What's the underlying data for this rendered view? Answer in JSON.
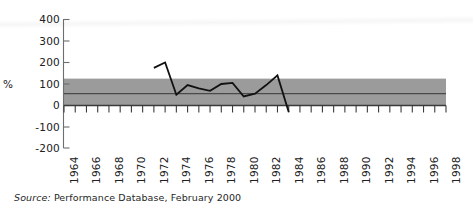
{
  "chart_data": {
    "type": "line",
    "title": "",
    "subtitle": "",
    "xlabel": "",
    "ylabel": "%",
    "ylim": [
      -200,
      400
    ],
    "xlim": [
      1964,
      1998
    ],
    "grid": false,
    "legend": null,
    "y_ticks": [
      400,
      300,
      200,
      100,
      0,
      -100,
      -200
    ],
    "y_tick_labels": [
      "400",
      "300",
      "200",
      "100",
      "0",
      "-100",
      "-200"
    ],
    "x_ticks": [
      1964,
      1966,
      1968,
      1970,
      1972,
      1974,
      1976,
      1978,
      1980,
      1982,
      1984,
      1986,
      1988,
      1990,
      1992,
      1994,
      1996,
      1998
    ],
    "x_tick_labels": [
      "1964",
      "1966",
      "1968",
      "1970",
      "1972",
      "1974",
      "1976",
      "1978",
      "1980",
      "1982",
      "1984",
      "1986",
      "1988",
      "1990",
      "1992",
      "1994",
      "1996",
      "1998"
    ],
    "x_minor_tick_step": 1,
    "series": [
      {
        "name": "performance",
        "color": "#111111",
        "x": [
          1972,
          1973,
          1974,
          1975,
          1976,
          1977,
          1978,
          1979,
          1980,
          1981,
          1982,
          1983,
          1984
        ],
        "values": [
          175,
          200,
          50,
          95,
          80,
          68,
          100,
          105,
          42,
          55,
          95,
          140,
          -30
        ]
      }
    ],
    "bands": [
      {
        "name": "interquartile-band",
        "color": "#9b9b9b",
        "y_low": 0,
        "y_high": 125,
        "x_start": 1964,
        "x_end": 1998
      }
    ],
    "reference_lines": [
      {
        "name": "median-line",
        "color": "#4a4a4a",
        "y": 55,
        "x_start": 1964,
        "x_end": 1998
      }
    ],
    "annotations": []
  },
  "source": {
    "prefix": "Source:",
    "text": "Performance Database, February 2000"
  }
}
